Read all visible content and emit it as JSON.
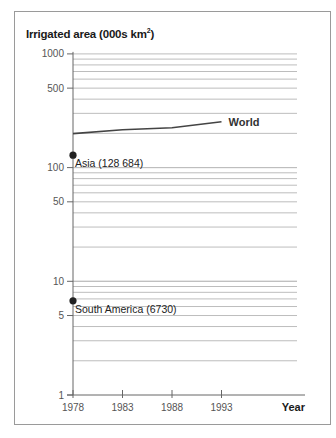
{
  "chart_data": {
    "type": "line",
    "title_main": "Irrigated area (000s km",
    "title_sup": "2",
    "title_end": ")",
    "xlabel": "Year",
    "ylabel": "Irrigated area (000s km²)",
    "yscale": "log",
    "ylim": [
      1,
      1000
    ],
    "y_ticks": [
      1000,
      500,
      100,
      50,
      10,
      5,
      1
    ],
    "y_tick_labels": [
      "1000",
      "500",
      "100",
      "50",
      "10",
      "5",
      "1"
    ],
    "x": [
      1978,
      1983,
      1988,
      1993
    ],
    "x_tick_labels": [
      "1978",
      "1983",
      "1988",
      "1993"
    ],
    "grid": true,
    "series": [
      {
        "name": "World",
        "values": [
          199,
          215,
          224,
          253
        ]
      }
    ],
    "points": [
      {
        "name": "Asia",
        "label": "Asia (128 684)",
        "x": 1978,
        "value": 128.684
      },
      {
        "name": "South America",
        "label": "South America (6730)",
        "x": 1978,
        "value": 6.73
      }
    ],
    "legend": "inline labels"
  }
}
